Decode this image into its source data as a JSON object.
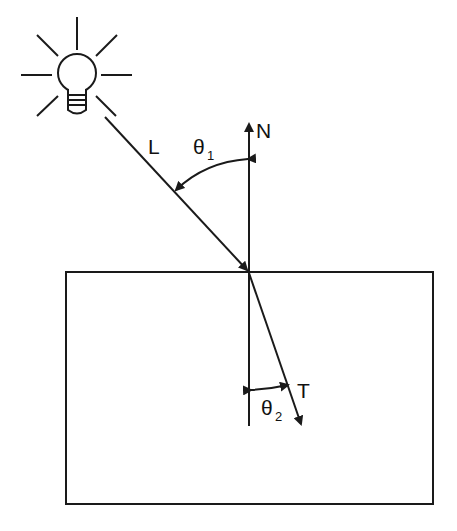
{
  "diagram": {
    "labels": {
      "light": "L",
      "normal": "N",
      "transmitted": "T",
      "theta1": "θ",
      "theta1_sub": "1",
      "theta2": "θ",
      "theta2_sub": "2"
    },
    "icons": {
      "light_source": "light-bulb-icon"
    },
    "colors": {
      "stroke": "#1a1a1a",
      "background": "#ffffff"
    }
  }
}
